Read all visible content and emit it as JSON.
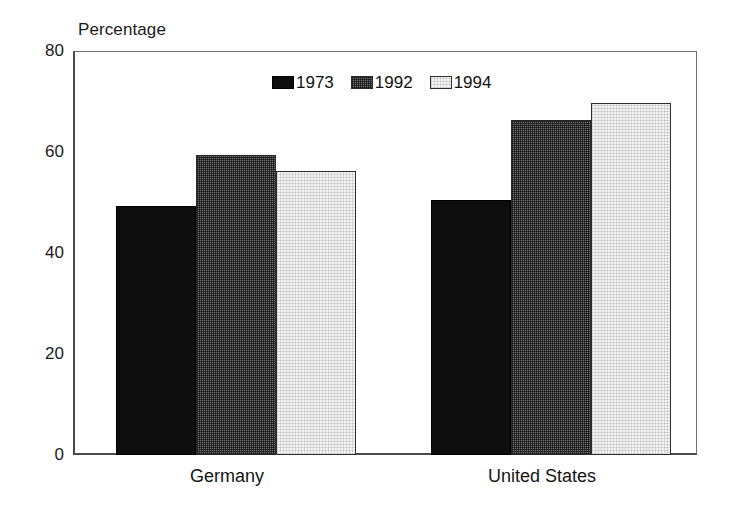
{
  "chart_data": {
    "type": "bar",
    "title": "Percentage",
    "xlabel": "",
    "ylabel": "Percentage",
    "categories": [
      "Germany",
      "United States"
    ],
    "series": [
      {
        "name": "1973",
        "values": [
          49.4,
          50.4
        ],
        "color": "#0d0d0d",
        "swatch": "sw-1973"
      },
      {
        "name": "1992",
        "values": [
          59.5,
          66.3
        ],
        "color": "#6b6b6b",
        "swatch": "sw-1992"
      },
      {
        "name": "1994",
        "values": [
          56.2,
          69.8
        ],
        "color": "#f2f2f2",
        "swatch": "sw-1994"
      }
    ],
    "ylim": [
      0,
      80
    ],
    "yticks": [
      0,
      20,
      40,
      60,
      80
    ],
    "ytick_labels": [
      "0",
      "20",
      "40",
      "60",
      "80"
    ],
    "grid": false,
    "legend_position": "top-center"
  },
  "axis": {
    "y_title": "Percentage",
    "tick_0": "0",
    "tick_20": "20",
    "tick_40": "40",
    "tick_60": "60",
    "tick_80": "80"
  },
  "legend": {
    "items": [
      {
        "label": "1973"
      },
      {
        "label": "1992"
      },
      {
        "label": "1994"
      }
    ]
  },
  "xaxis": {
    "categories": [
      {
        "label": "Germany"
      },
      {
        "label": "United States"
      }
    ]
  }
}
